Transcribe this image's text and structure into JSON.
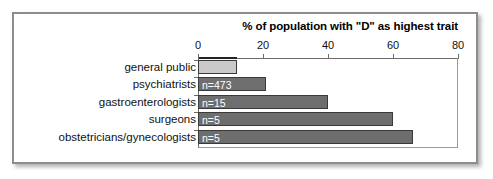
{
  "chart_data": {
    "type": "bar",
    "orientation": "horizontal",
    "title": "% of population with \"D\" as highest trait",
    "xlabel": "",
    "ylabel": "",
    "xlim": [
      0,
      80
    ],
    "xticks": [
      0,
      20,
      40,
      60,
      80
    ],
    "xtick_labels": [
      "0",
      "20",
      "40",
      "60",
      "80"
    ],
    "grid": false,
    "legend": false,
    "categories": [
      "general public",
      "psychiatrists",
      "gastroenterologists",
      "surgeons",
      "obstetricians/gynecologists"
    ],
    "values": [
      12,
      21,
      40,
      60,
      66
    ],
    "bar_labels": [
      "",
      "n=473",
      "n=15",
      "n=5",
      "n=5"
    ],
    "bars": [
      {
        "category": "general public",
        "value": 12,
        "n_label": "",
        "color": "#c9c9c9"
      },
      {
        "category": "psychiatrists",
        "value": 21,
        "n_label": "n=473",
        "color": "#6e6e6e"
      },
      {
        "category": "gastroenterologists",
        "value": 40,
        "n_label": "n=15",
        "color": "#6e6e6e"
      },
      {
        "category": "surgeons",
        "value": 60,
        "n_label": "n=5",
        "color": "#6e6e6e"
      },
      {
        "category": "obstetricians/gynecologists",
        "value": 66,
        "n_label": "n=5",
        "color": "#6e6e6e"
      }
    ],
    "colors": {
      "bar_default": "#6e6e6e",
      "bar_highlight": "#c9c9c9",
      "bar_outline": "#3a3a3a",
      "axis": "#6b6b6b",
      "frame": "#8d8d8d",
      "text": "#111111",
      "bar_label_text": "#ffffff",
      "background": "#ffffff"
    }
  }
}
